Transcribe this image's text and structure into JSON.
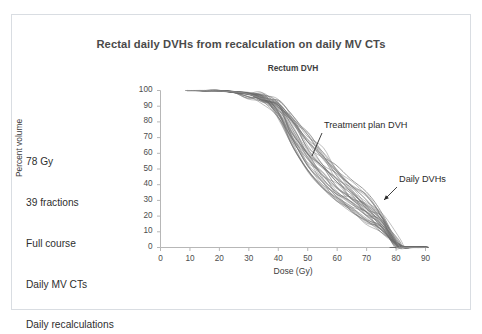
{
  "slide": {
    "title": "Rectal daily DVHs from recalculation on daily MV CTs",
    "notes": [
      "78 Gy",
      "39 fractions",
      "Full course",
      "Daily MV CTs",
      "Daily recalculations"
    ],
    "frame_color": "#d9dde2",
    "background_color": "#ffffff"
  },
  "chart_data": {
    "type": "line",
    "title": "Rectum DVH",
    "xlabel": "Dose (Gy)",
    "ylabel": "Percent volume",
    "xlim": [
      0,
      90
    ],
    "ylim": [
      0,
      100
    ],
    "xticks": [
      0,
      10,
      20,
      30,
      40,
      50,
      60,
      70,
      80,
      90
    ],
    "yticks": [
      0,
      10,
      20,
      30,
      40,
      50,
      60,
      70,
      80,
      90,
      100
    ],
    "grid": false,
    "legend": "none",
    "line_color": "#6b6b6b",
    "highlight_color": "#8f8f8f",
    "annotations": [
      {
        "label": "Treatment plan DVH",
        "text_x": 324,
        "text_y": 120,
        "leader_from_x": 322,
        "leader_from_y": 133,
        "leader_to_x": 312,
        "leader_to_y": 156
      },
      {
        "label": "Daily DVHs",
        "text_x": 399,
        "text_y": 174,
        "leader_from_x": 397,
        "leader_from_y": 187,
        "leader_to_x": 384,
        "leader_to_y": 200
      }
    ],
    "series_note": "Approximately 39 daily recalculated rectum dose-volume histograms plus the treatment plan DVH; all curves start at 100% volume at low dose, shoulder near 40-48 Gy, and fall to 0% near 78-83 Gy.",
    "x": [
      0,
      5,
      10,
      15,
      20,
      25,
      30,
      35,
      40,
      45,
      50,
      55,
      60,
      65,
      70,
      75,
      80,
      83,
      85,
      90
    ],
    "series": [
      {
        "name": "Daily DVH 1",
        "values": [
          100,
          100,
          100,
          100,
          100,
          99,
          98,
          96,
          90,
          76,
          62,
          51,
          42,
          34,
          26,
          17,
          3,
          0,
          0,
          0
        ]
      },
      {
        "name": "Daily DVH 2",
        "values": [
          100,
          100,
          100,
          100,
          100,
          99,
          98,
          96,
          91,
          79,
          66,
          55,
          45,
          36,
          28,
          18,
          3,
          0,
          0,
          0
        ]
      },
      {
        "name": "Daily DVH 3",
        "values": [
          100,
          100,
          100,
          100,
          100,
          99,
          97,
          95,
          88,
          72,
          57,
          46,
          37,
          29,
          22,
          14,
          2,
          0,
          0,
          0
        ]
      },
      {
        "name": "Daily DVH 4",
        "values": [
          100,
          100,
          100,
          100,
          100,
          99,
          98,
          95,
          87,
          70,
          54,
          43,
          34,
          27,
          20,
          13,
          2,
          0,
          0,
          0
        ]
      },
      {
        "name": "Daily DVH 5",
        "values": [
          100,
          100,
          100,
          100,
          100,
          99,
          98,
          96,
          92,
          81,
          69,
          58,
          48,
          39,
          30,
          20,
          4,
          0,
          0,
          0
        ]
      },
      {
        "name": "Daily DVH 6",
        "values": [
          100,
          100,
          100,
          100,
          100,
          99,
          97,
          94,
          85,
          67,
          51,
          40,
          32,
          25,
          18,
          11,
          2,
          0,
          0,
          0
        ]
      },
      {
        "name": "Daily DVH 7",
        "values": [
          100,
          100,
          100,
          100,
          100,
          99,
          98,
          95,
          89,
          74,
          59,
          48,
          39,
          31,
          23,
          15,
          3,
          0,
          0,
          0
        ]
      },
      {
        "name": "Daily DVH 8",
        "values": [
          100,
          100,
          100,
          100,
          100,
          99,
          98,
          96,
          90,
          77,
          64,
          53,
          43,
          35,
          27,
          17,
          3,
          0,
          0,
          0
        ]
      },
      {
        "name": "Daily DVH 9",
        "values": [
          100,
          100,
          100,
          100,
          100,
          99,
          97,
          94,
          84,
          65,
          49,
          38,
          30,
          23,
          17,
          10,
          2,
          0,
          0,
          0
        ]
      },
      {
        "name": "Daily DVH 10",
        "values": [
          100,
          100,
          100,
          100,
          100,
          99,
          98,
          96,
          91,
          80,
          67,
          56,
          46,
          37,
          29,
          19,
          4,
          0,
          0,
          0
        ]
      },
      {
        "name": "Daily DVH 11",
        "values": [
          100,
          100,
          100,
          100,
          100,
          99,
          98,
          95,
          88,
          73,
          58,
          47,
          38,
          30,
          22,
          14,
          2,
          0,
          0,
          0
        ]
      },
      {
        "name": "Daily DVH 12",
        "values": [
          100,
          100,
          100,
          100,
          100,
          99,
          97,
          95,
          86,
          69,
          53,
          42,
          33,
          26,
          19,
          12,
          2,
          0,
          0,
          0
        ]
      },
      {
        "name": "Daily DVH 13",
        "values": [
          100,
          100,
          100,
          100,
          100,
          99,
          98,
          96,
          92,
          83,
          72,
          61,
          50,
          41,
          32,
          21,
          4,
          0,
          0,
          0
        ]
      },
      {
        "name": "Daily DVH 14",
        "values": [
          100,
          100,
          100,
          100,
          100,
          99,
          98,
          96,
          90,
          78,
          65,
          54,
          44,
          35,
          27,
          18,
          3,
          0,
          0,
          0
        ]
      },
      {
        "name": "Daily DVH 15",
        "values": [
          100,
          100,
          100,
          100,
          100,
          99,
          97,
          94,
          85,
          66,
          50,
          39,
          31,
          24,
          18,
          11,
          2,
          0,
          0,
          0
        ]
      },
      {
        "name": "Daily DVH 16",
        "values": [
          100,
          100,
          100,
          100,
          100,
          99,
          98,
          95,
          89,
          75,
          61,
          50,
          40,
          32,
          24,
          16,
          3,
          0,
          0,
          0
        ]
      },
      {
        "name": "Daily DVH 17",
        "values": [
          100,
          100,
          100,
          100,
          100,
          99,
          98,
          96,
          91,
          79,
          66,
          55,
          45,
          36,
          28,
          18,
          3,
          0,
          0,
          0
        ]
      },
      {
        "name": "Daily DVH 18",
        "values": [
          100,
          100,
          100,
          100,
          100,
          99,
          97,
          95,
          87,
          71,
          56,
          45,
          36,
          28,
          21,
          13,
          2,
          0,
          0,
          0
        ]
      },
      {
        "name": "Daily DVH 19",
        "values": [
          100,
          100,
          100,
          100,
          100,
          99,
          98,
          96,
          90,
          77,
          63,
          52,
          42,
          34,
          26,
          17,
          3,
          0,
          0,
          0
        ]
      },
      {
        "name": "Daily DVH 20",
        "values": [
          100,
          100,
          100,
          100,
          100,
          99,
          97,
          94,
          83,
          63,
          47,
          36,
          29,
          22,
          16,
          10,
          2,
          0,
          0,
          0
        ]
      },
      {
        "name": "Daily DVH 21",
        "values": [
          100,
          100,
          100,
          100,
          100,
          99,
          98,
          96,
          92,
          82,
          70,
          59,
          49,
          40,
          31,
          20,
          4,
          0,
          0,
          0
        ]
      },
      {
        "name": "Daily DVH 22",
        "values": [
          100,
          100,
          100,
          100,
          100,
          99,
          98,
          95,
          88,
          72,
          57,
          46,
          37,
          29,
          22,
          14,
          2,
          0,
          0,
          0
        ]
      },
      {
        "name": "Daily DVH 23",
        "values": [
          100,
          100,
          100,
          100,
          100,
          99,
          97,
          95,
          86,
          68,
          52,
          41,
          33,
          26,
          19,
          12,
          2,
          0,
          0,
          0
        ]
      },
      {
        "name": "Daily DVH 24",
        "values": [
          100,
          100,
          100,
          100,
          100,
          99,
          98,
          96,
          91,
          80,
          68,
          57,
          47,
          38,
          29,
          19,
          4,
          0,
          0,
          0
        ]
      },
      {
        "name": "Daily DVH 25",
        "values": [
          100,
          100,
          100,
          100,
          100,
          99,
          98,
          95,
          89,
          74,
          60,
          49,
          40,
          31,
          24,
          15,
          3,
          0,
          0,
          0
        ]
      },
      {
        "name": "Daily DVH 26",
        "values": [
          100,
          100,
          100,
          100,
          100,
          99,
          97,
          94,
          84,
          64,
          48,
          37,
          30,
          23,
          17,
          10,
          2,
          0,
          0,
          0
        ]
      },
      {
        "name": "Daily DVH 27",
        "values": [
          100,
          100,
          100,
          100,
          100,
          99,
          98,
          96,
          90,
          76,
          62,
          51,
          41,
          33,
          25,
          16,
          3,
          0,
          0,
          0
        ]
      },
      {
        "name": "Daily DVH 28",
        "values": [
          100,
          100,
          100,
          100,
          100,
          99,
          98,
          96,
          93,
          84,
          73,
          62,
          51,
          42,
          33,
          22,
          5,
          0,
          0,
          0
        ]
      },
      {
        "name": "Daily DVH 29",
        "values": [
          100,
          100,
          100,
          100,
          100,
          99,
          97,
          95,
          87,
          70,
          55,
          44,
          35,
          28,
          21,
          13,
          2,
          0,
          0,
          0
        ]
      },
      {
        "name": "Daily DVH 30",
        "values": [
          100,
          100,
          100,
          100,
          100,
          99,
          98,
          95,
          88,
          73,
          59,
          48,
          39,
          31,
          23,
          15,
          3,
          0,
          0,
          0
        ]
      },
      {
        "name": "Daily DVH 31",
        "values": [
          100,
          100,
          100,
          100,
          100,
          99,
          97,
          94,
          85,
          67,
          51,
          40,
          32,
          25,
          18,
          11,
          2,
          0,
          0,
          0
        ]
      },
      {
        "name": "Daily DVH 32",
        "values": [
          100,
          100,
          100,
          100,
          100,
          99,
          98,
          96,
          91,
          81,
          69,
          58,
          48,
          39,
          30,
          20,
          4,
          0,
          0,
          0
        ]
      },
      {
        "name": "Daily DVH 33",
        "values": [
          100,
          100,
          100,
          100,
          100,
          99,
          98,
          96,
          90,
          75,
          61,
          50,
          41,
          32,
          25,
          16,
          3,
          0,
          0,
          0
        ]
      },
      {
        "name": "Daily DVH 34",
        "values": [
          100,
          100,
          100,
          100,
          100,
          99,
          97,
          95,
          86,
          69,
          54,
          43,
          34,
          27,
          20,
          12,
          2,
          0,
          0,
          0
        ]
      },
      {
        "name": "Daily DVH 35",
        "values": [
          100,
          100,
          100,
          100,
          100,
          99,
          98,
          96,
          92,
          82,
          71,
          60,
          49,
          40,
          31,
          21,
          4,
          0,
          0,
          0
        ]
      },
      {
        "name": "Daily DVH 36",
        "values": [
          100,
          100,
          100,
          100,
          100,
          99,
          98,
          95,
          89,
          74,
          60,
          49,
          39,
          31,
          23,
          15,
          3,
          0,
          0,
          0
        ]
      },
      {
        "name": "Daily DVH 37",
        "values": [
          100,
          100,
          100,
          100,
          100,
          99,
          97,
          94,
          84,
          65,
          49,
          38,
          30,
          24,
          17,
          11,
          2,
          0,
          0,
          0
        ]
      },
      {
        "name": "Daily DVH 38",
        "values": [
          100,
          100,
          100,
          100,
          100,
          99,
          98,
          96,
          90,
          78,
          64,
          53,
          43,
          35,
          27,
          18,
          3,
          0,
          0,
          0
        ]
      },
      {
        "name": "Daily DVH 39",
        "values": [
          100,
          100,
          100,
          100,
          100,
          99,
          98,
          95,
          87,
          71,
          56,
          45,
          36,
          29,
          21,
          14,
          2,
          0,
          0,
          0
        ]
      },
      {
        "name": "Treatment plan DVH",
        "values": [
          100,
          100,
          100,
          100,
          100,
          99,
          98,
          96,
          92,
          83,
          72,
          61,
          51,
          42,
          33,
          22,
          5,
          0,
          0,
          0
        ]
      }
    ]
  }
}
